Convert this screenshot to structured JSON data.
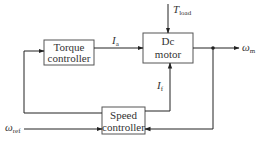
{
  "diagram": {
    "type": "block-diagram",
    "title": "",
    "blocks": {
      "torque": {
        "line1": "Torque",
        "line2": "controller"
      },
      "motor": {
        "line1": "Dc",
        "line2": "motor"
      },
      "speed": {
        "line1": "Speed",
        "line2": "controller"
      }
    },
    "signals": {
      "armature_current": {
        "symbol": "I",
        "subscript": "a"
      },
      "field_current": {
        "symbol": "I",
        "subscript": "f"
      },
      "load_torque": {
        "symbol": "T",
        "subscript": "load"
      },
      "motor_speed": {
        "symbol": "ω",
        "subscript": "m"
      },
      "reference_speed": {
        "symbol": "ω",
        "subscript": "ref"
      }
    },
    "colors": {
      "stroke": "#222222",
      "box_border": "#555555",
      "text": "#333333"
    }
  }
}
